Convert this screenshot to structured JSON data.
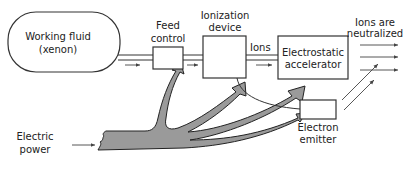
{
  "diagram": {
    "nodes": {
      "working_fluid": {
        "line1": "Working fluid",
        "line2": "(xenon)"
      },
      "feed_control": {
        "line1": "Feed",
        "line2": "control"
      },
      "ionization_device": {
        "line1": "Ionization",
        "line2": "device"
      },
      "electrostatic_accelerator": {
        "line1": "Electrostatic",
        "line2": "accelerator"
      },
      "electron_emitter": {
        "line1": "Electron",
        "line2": "emitter"
      }
    },
    "labels": {
      "ions": "Ions",
      "ions_neutralized_line1": "Ions are",
      "ions_neutralized_line2": "neutralized",
      "electric_power_line1": "Electric",
      "electric_power_line2": "power"
    },
    "edges": [
      {
        "from": "working_fluid",
        "to": "feed_control",
        "type": "fluid-flow"
      },
      {
        "from": "feed_control",
        "to": "ionization_device",
        "type": "fluid-flow"
      },
      {
        "from": "ionization_device",
        "to": "electrostatic_accelerator",
        "type": "ion-flow"
      },
      {
        "from": "ionization_device",
        "to": "electron_emitter",
        "type": "electron-line"
      },
      {
        "from": "electric_power",
        "to": "feed_control",
        "type": "power"
      },
      {
        "from": "electric_power",
        "to": "ionization_device",
        "type": "power"
      },
      {
        "from": "electric_power",
        "to": "electrostatic_accelerator",
        "type": "power"
      },
      {
        "from": "electric_power",
        "to": "electron_emitter",
        "type": "power"
      },
      {
        "from": "electron_emitter",
        "to": "ion_beam",
        "type": "electrons"
      }
    ]
  }
}
